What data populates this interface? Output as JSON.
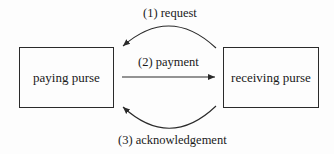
{
  "diagram": {
    "nodes": [
      {
        "id": "paying",
        "label": "paying purse"
      },
      {
        "id": "receiving",
        "label": "receiving purse"
      }
    ],
    "edges": [
      {
        "from": "receiving",
        "to": "paying",
        "label": "(1) request",
        "style": "curved-top"
      },
      {
        "from": "paying",
        "to": "receiving",
        "label": "(2) payment",
        "style": "straight"
      },
      {
        "from": "receiving",
        "to": "paying",
        "label": "(3) acknowledgement",
        "style": "curved-bottom"
      }
    ],
    "colors": {
      "stroke": "#2a2a2a",
      "background": "#fdfdfd"
    }
  }
}
